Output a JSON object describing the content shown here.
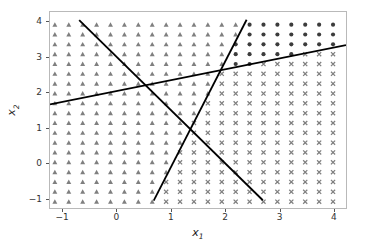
{
  "chart_data": {
    "type": "scatter",
    "title": "",
    "xlabel": "x_1",
    "ylabel": "x_2",
    "xlim": [
      -1.24,
      4.24
    ],
    "ylim": [
      -1.28,
      4.28
    ],
    "grid": false,
    "legend": null,
    "x_ticks": [
      -1,
      0,
      1,
      2,
      3,
      4
    ],
    "y_ticks": [
      -1,
      0,
      1,
      2,
      3,
      4
    ],
    "x_tick_labels": [
      "−1",
      "0",
      "1",
      "2",
      "3",
      "4"
    ],
    "y_tick_labels": [
      "−1",
      "0",
      "1",
      "2",
      "3",
      "4"
    ],
    "grid_mesh": {
      "x_start": -1.15,
      "x_step": 0.2575,
      "x_count": 21,
      "y_start": -1.1,
      "y_step": 0.2789,
      "y_count": 19
    },
    "classes": [
      {
        "name": "class-0",
        "marker": "circle",
        "color": "#3c3c3c",
        "size": 4.0
      },
      {
        "name": "class-1",
        "marker": "cross",
        "color": "#7f7f7f",
        "size": 4.0
      },
      {
        "name": "class-2",
        "marker": "triangle",
        "color": "#7f7f7f",
        "size": 4.0
      }
    ],
    "region_rules": {
      "comment": "Class assigned per mesh point by the three boundary lines",
      "line_A": {
        "name": "boundary-descending",
        "p1": [
          -0.7,
          4.05
        ],
        "p2": [
          2.7,
          -1.06
        ],
        "slope": -1.503,
        "intercept": 2.998
      },
      "line_B": {
        "name": "boundary-shallow-ascending",
        "p1": [
          -1.24,
          1.66
        ],
        "p2": [
          4.24,
          3.34
        ],
        "slope": 0.3066,
        "intercept": 2.04
      },
      "line_C": {
        "name": "boundary-steep-ascending",
        "p1": [
          0.68,
          -1.07
        ],
        "p2": [
          2.4,
          4.06
        ],
        "slope": 2.983,
        "intercept": -3.098
      }
    },
    "boundaries": [
      {
        "name": "boundary-descending",
        "x1": -0.7,
        "y1": 4.05,
        "x2": 2.7,
        "y2": -1.06,
        "color": "#000000",
        "width": 1.8
      },
      {
        "name": "boundary-shallow-ascending",
        "x1": -1.24,
        "y1": 1.66,
        "x2": 4.24,
        "y2": 3.34,
        "color": "#000000",
        "width": 1.8
      },
      {
        "name": "boundary-steep-ascending",
        "x1": 0.68,
        "y1": -1.07,
        "x2": 2.4,
        "y2": 4.06,
        "color": "#000000",
        "width": 1.8
      }
    ]
  },
  "figure": {
    "background": "#ffffff",
    "axes_frame_color": "#b9b9b9",
    "tick_color": "#555555",
    "tick_label_color": "#333333"
  }
}
